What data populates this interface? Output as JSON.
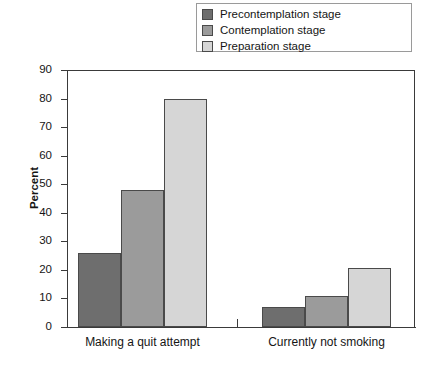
{
  "legend": {
    "position": "top-right",
    "entries": [
      {
        "label": "Precontemplation stage",
        "color": "#6e6e6e",
        "swatch_name": "legend-swatch-precontemplation"
      },
      {
        "label": "Contemplation stage",
        "color": "#9b9b9b",
        "swatch_name": "legend-swatch-contemplation"
      },
      {
        "label": "Preparation stage",
        "color": "#d6d6d6",
        "swatch_name": "legend-swatch-preparation"
      }
    ]
  },
  "axis": {
    "y_label": "Percent",
    "y_ticks": [
      "0",
      "10",
      "20",
      "30",
      "40",
      "50",
      "60",
      "70",
      "80",
      "90"
    ]
  },
  "chart_data": {
    "type": "bar",
    "title": "",
    "xlabel": "",
    "ylabel": "Percent",
    "ylim": [
      0,
      90
    ],
    "ytick_step": 10,
    "grid": false,
    "legend_position": "top-right",
    "categories": [
      "Making a quit attempt",
      "Currently not smoking"
    ],
    "series": [
      {
        "name": "Precontemplation stage",
        "color": "#6e6e6e",
        "values": [
          26,
          7
        ]
      },
      {
        "name": "Contemplation stage",
        "color": "#9b9b9b",
        "values": [
          48,
          11
        ]
      },
      {
        "name": "Preparation stage",
        "color": "#d6d6d6",
        "values": [
          80,
          20.5
        ]
      }
    ]
  }
}
